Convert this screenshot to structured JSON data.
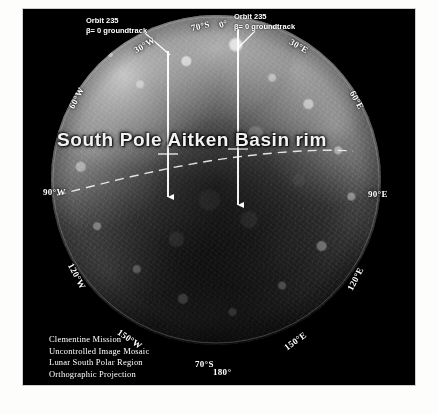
{
  "figure": {
    "background_color": "#000000",
    "page_color": "#fdfdfb"
  },
  "feature_label": {
    "text": "South Pole Aitken Basin rim"
  },
  "callouts": [
    {
      "id": "orbit-left",
      "line1": "Orbit 235",
      "line2": "β= 0 groundtrack"
    },
    {
      "id": "orbit-right",
      "line1": "Orbit 235",
      "line2": "β= 0 groundtrack"
    }
  ],
  "graticule": {
    "latitude_labels": [
      {
        "id": "lat-top",
        "text": "70°S"
      },
      {
        "id": "lat-bottom",
        "text": "70°S"
      }
    ],
    "longitude_labels": [
      {
        "id": "lon-0",
        "text": "0°"
      },
      {
        "id": "lon-30w",
        "text": "30°W"
      },
      {
        "id": "lon-60w",
        "text": "60°W"
      },
      {
        "id": "lon-90w",
        "text": "90°W"
      },
      {
        "id": "lon-120w",
        "text": "120°W"
      },
      {
        "id": "lon-150w",
        "text": "150°W"
      },
      {
        "id": "lon-180",
        "text": "180°"
      },
      {
        "id": "lon-150e",
        "text": "150°E"
      },
      {
        "id": "lon-120e",
        "text": "120°E"
      },
      {
        "id": "lon-90e",
        "text": "90°E"
      },
      {
        "id": "lon-60e",
        "text": "60°E"
      },
      {
        "id": "lon-30e",
        "text": "30°E"
      }
    ]
  },
  "credit": {
    "line1": "Clementine Mission",
    "line2": "Uncontrolled Image Mosaic",
    "line3": "Lunar South Polar Region",
    "line4": "Orthographic Projection"
  }
}
